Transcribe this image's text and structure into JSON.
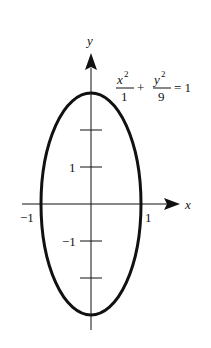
{
  "diagram": {
    "type": "ellipse-plot",
    "equation": {
      "term1_numerator": "x",
      "term1_numerator_exponent": "2",
      "term1_denominator": "1",
      "plus": "+",
      "term2_numerator": "y",
      "term2_numerator_exponent": "2",
      "term2_denominator": "9",
      "rhs": "= 1"
    },
    "axes": {
      "x_label": "x",
      "y_label": "y"
    },
    "ellipse": {
      "a": 1,
      "b": 3,
      "center": [
        0,
        0
      ]
    },
    "x_ticks": [
      {
        "value": -1,
        "label": "−1"
      },
      {
        "value": 1,
        "label": "1"
      }
    ],
    "y_ticks": [
      {
        "value": 2,
        "label": ""
      },
      {
        "value": 1,
        "label": "1"
      },
      {
        "value": -1,
        "label": "−1"
      },
      {
        "value": -2,
        "label": ""
      }
    ],
    "stroke_color": "#111111"
  }
}
